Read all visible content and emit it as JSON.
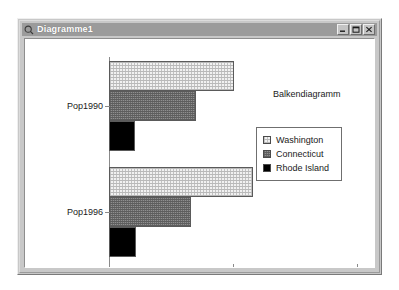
{
  "window": {
    "title": "Diagramme1",
    "icon": "chart-document-icon",
    "controls": [
      {
        "name": "minimize-button",
        "glyph": "minimize-icon"
      },
      {
        "name": "maximize-button",
        "glyph": "maximize-icon"
      },
      {
        "name": "close-button",
        "glyph": "close-icon"
      }
    ]
  },
  "chart_data": {
    "type": "bar",
    "orientation": "horizontal",
    "title": "Balkendiagramm",
    "xlabel": "",
    "ylabel": "",
    "categories": [
      "Pop1990",
      "Pop1996"
    ],
    "series": [
      {
        "name": "Washington",
        "values": [
          5040000,
          5800000
        ],
        "color": "#f1f1f1",
        "pattern": "fine-crosshatch"
      },
      {
        "name": "Connecticut",
        "values": [
          3500000,
          3300000
        ],
        "color": "#8f8f8f",
        "pattern": "dense-crosshatch"
      },
      {
        "name": "Rhode Island",
        "values": [
          1050000,
          1100000
        ],
        "color": "#000000",
        "pattern": "solid"
      }
    ],
    "xlim": [
      0,
      10000000
    ],
    "xticks": [
      0,
      5000000,
      10000000
    ],
    "xticklabels": [
      "0",
      "5000000",
      "10000000"
    ],
    "grid": false,
    "legend_position": "center-right",
    "legend_entries": [
      "Washington",
      "Connecticut",
      "Rhode Island"
    ]
  },
  "colors": {
    "window_face": "#c8c8c8",
    "titlebar": "#9b9b9b",
    "titlebar_text": "#ffffff",
    "plot_background": "#ffffff",
    "axis": "#8a8a8a",
    "text": "#1a1a1a"
  }
}
